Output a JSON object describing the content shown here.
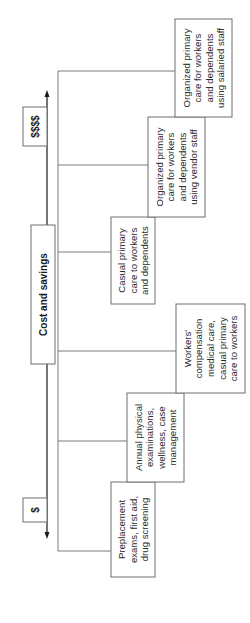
{
  "diagram": {
    "orientation": "rotated-90-ccw",
    "axis": {
      "low_label": "$",
      "high_label": "$$$$",
      "direction": "bidirectional-arrow"
    },
    "root": {
      "label": "Cost and savings"
    },
    "items": [
      {
        "lines": [
          "Preplacement",
          "exams, first aid,",
          "drug screening"
        ]
      },
      {
        "lines": [
          "Annual physical",
          "examinations,",
          "wellness, case",
          "management"
        ]
      },
      {
        "lines": [
          "Workers'",
          "compensation",
          "medical care,",
          "casual primary",
          "care to workers"
        ]
      },
      {
        "lines": [
          "Casual primary",
          "care to workers",
          "and dependents"
        ]
      },
      {
        "lines": [
          "Organized primary",
          "care for workers",
          "and dependents",
          "using vendor staff"
        ]
      },
      {
        "lines": [
          "Organized primary",
          "care for workers",
          "and dependents",
          "using salaried staff"
        ]
      }
    ]
  }
}
